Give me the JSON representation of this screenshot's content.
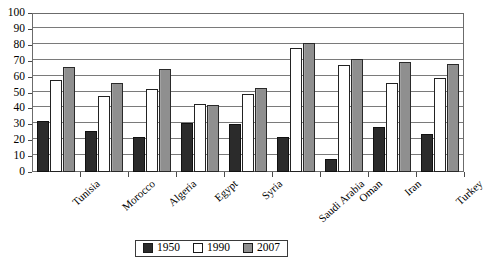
{
  "chart_data": {
    "type": "bar",
    "title": "",
    "subtitle": "",
    "xlabel": "",
    "ylabel": "",
    "ylim": [
      0,
      100
    ],
    "ytick_step": 10,
    "yticks": [
      0,
      10,
      20,
      30,
      40,
      50,
      60,
      70,
      80,
      90,
      100
    ],
    "grid": true,
    "legend_position": "bottom",
    "categories": [
      "Tunisia",
      "Morocco",
      "Algeria",
      "Egypt",
      "Syria",
      "Saudi Arabia",
      "Oman",
      "Iran",
      "Turkey"
    ],
    "series": [
      {
        "name": "1950",
        "color": "#2b2b2b",
        "values": [
          32,
          26,
          22,
          31,
          30,
          22,
          8,
          28,
          24
        ]
      },
      {
        "name": "1990",
        "color": "#ffffff",
        "values": [
          58,
          48,
          52,
          43,
          49,
          78,
          67,
          56,
          59
        ]
      },
      {
        "name": "2007",
        "color": "#8f8f8f",
        "values": [
          66,
          56,
          65,
          42,
          53,
          81,
          71,
          69,
          68
        ]
      }
    ]
  },
  "legend": {
    "items": [
      {
        "label": "1950",
        "swatch": "s1950"
      },
      {
        "label": "1990",
        "swatch": "s1990"
      },
      {
        "label": "2007",
        "swatch": "s2007"
      }
    ]
  }
}
